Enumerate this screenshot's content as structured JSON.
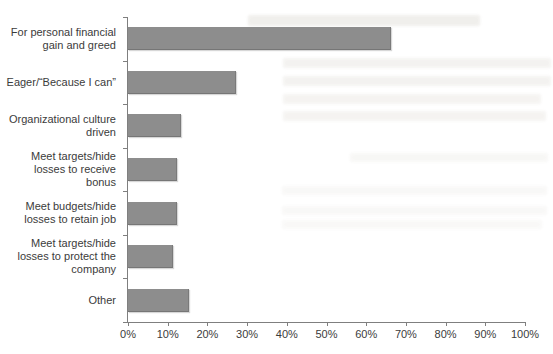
{
  "chart_data": {
    "type": "bar",
    "orientation": "horizontal",
    "title": "",
    "xlabel": "",
    "ylabel": "",
    "categories": [
      "For personal financial gain and greed",
      "Eager/“Because I can”",
      "Organizational culture driven",
      "Meet targets/hide losses to receive bonus",
      "Meet budgets/hide losses to retain job",
      "Meet targets/hide losses to protect the company",
      "Other"
    ],
    "category_label_lines": [
      [
        "For personal financial",
        "gain and greed"
      ],
      [
        "Eager/“Because I can”"
      ],
      [
        "Organizational culture",
        "driven"
      ],
      [
        "Meet targets/hide",
        "losses to receive",
        "bonus"
      ],
      [
        "Meet budgets/hide",
        "losses to retain job"
      ],
      [
        "Meet targets/hide",
        "losses to protect the",
        "company"
      ],
      [
        "Other"
      ]
    ],
    "values": [
      66,
      27,
      13,
      12,
      12,
      11,
      15
    ],
    "unit": "%",
    "xlim": [
      0,
      100
    ],
    "x_tick_step": 10,
    "x_ticks": [
      "0%",
      "10%",
      "20%",
      "30%",
      "40%",
      "50%",
      "60%",
      "70%",
      "80%",
      "90%",
      "100%"
    ],
    "grid": false,
    "legend": "none",
    "bar_color": "#8d8d8d",
    "axis_color": "#7f7f7f",
    "label_color": "#3b3b3b"
  }
}
